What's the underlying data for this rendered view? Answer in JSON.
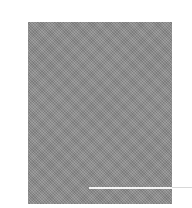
{
  "image": {
    "background_color": "#ffffff",
    "panel_color": "#8a8a8a",
    "rule_color": "#f4f4f4",
    "rule_tail_color": "#d8d8d8"
  }
}
